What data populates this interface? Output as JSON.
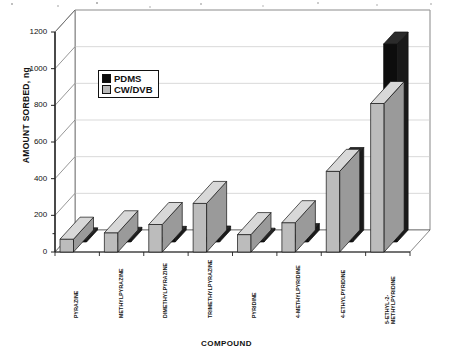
{
  "chart_data": {
    "type": "bar",
    "title": "",
    "subtitle": "",
    "xlabel": "COMPOUND",
    "ylabel": "AMOUNT SORBED, ng",
    "ylim": [
      0,
      1200
    ],
    "yticks": [
      0,
      200,
      400,
      600,
      800,
      1000,
      1200
    ],
    "ytick_labels": [
      "0",
      "200",
      "400",
      "600",
      "800",
      "1000",
      "1200"
    ],
    "grid": true,
    "grid_axis": "y",
    "legend_position": "upper-left-inside",
    "style": "3d-bar",
    "categories": [
      "PYRAZINE",
      "METHYLPYRAZINE",
      "DIMETHYLPYRAZINE",
      "TRIMETHYLPYRAZINE",
      "PYRIDINE",
      "4-METHYLPYRIDINE",
      "4-ETHYLPYRIDINE",
      "5-ETHYL-2-METHYLPYRIDINE"
    ],
    "category_label_lines": [
      [
        "PYRAZINE"
      ],
      [
        "METHYLPYRAZINE"
      ],
      [
        "DIMETHYLPYRAZINE"
      ],
      [
        "TRIMETHYLPYRAZINE"
      ],
      [
        "PYRIDINE"
      ],
      [
        "4-METHYLPYRIDINE"
      ],
      [
        "4-ETHYLPYRIDINE"
      ],
      [
        "5-ETHYL-2-",
        "METHYLPYRIDINE"
      ]
    ],
    "series": [
      {
        "name": "PDMS",
        "color": "#0b0b0b",
        "values": [
          12,
          15,
          20,
          22,
          10,
          35,
          450,
          1080
        ]
      },
      {
        "name": "CW/DVB",
        "color": "#b9b9b9",
        "values": [
          70,
          105,
          150,
          265,
          95,
          160,
          440,
          810
        ]
      }
    ]
  },
  "legend": {
    "items": [
      {
        "label": "PDMS",
        "swatch": "sw-pdms"
      },
      {
        "label": "CW/DVB",
        "swatch": "sw-cwdvb"
      }
    ]
  }
}
